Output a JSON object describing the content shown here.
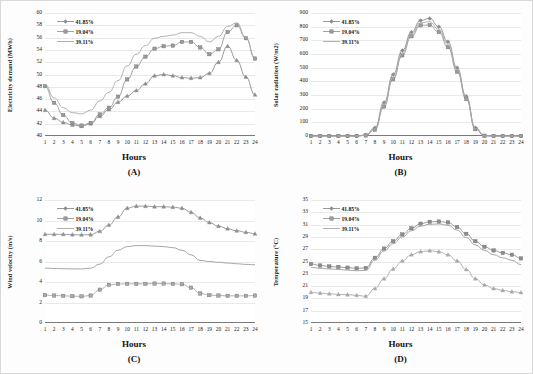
{
  "figure": {
    "background": "#fdfdfd",
    "series_colors": [
      "#8d8d8d",
      "#9a9a9a",
      "#a8a8a8"
    ],
    "panels": [
      "(A)",
      "(B)",
      "(C)",
      "(D)"
    ]
  },
  "legend": {
    "items": [
      {
        "label": "41.85%",
        "marker": "diamond",
        "color": "#8a8a8a"
      },
      {
        "label": "19.04%",
        "marker": "square",
        "color": "#949494"
      },
      {
        "label": "39.11%",
        "marker": "none",
        "color": "#a0a0a0"
      }
    ]
  },
  "chart_data": [
    {
      "type": "line",
      "panel": "(A)",
      "title": "",
      "xlabel": "Hours",
      "ylabel": "Electricity demand (MWh)",
      "ylim": [
        40,
        60
      ],
      "yticks": [
        40,
        42,
        44,
        46,
        48,
        50,
        52,
        54,
        56,
        58,
        60
      ],
      "xlim": [
        1,
        24
      ],
      "x": [
        1,
        2,
        3,
        4,
        5,
        6,
        7,
        8,
        9,
        10,
        11,
        12,
        13,
        14,
        15,
        16,
        17,
        18,
        19,
        20,
        21,
        22,
        23,
        24
      ],
      "xticklabels": [
        "1",
        "2",
        "3",
        "4",
        "5",
        "6",
        "7",
        "8",
        "9",
        "10",
        "11",
        "12",
        "13",
        "14",
        "15",
        "16",
        "17",
        "18",
        "19",
        "20",
        "21",
        "22",
        "23",
        "24"
      ],
      "grid": true,
      "legend_position": "upper-left",
      "series": [
        {
          "name": "41.85%",
          "marker": "triangle",
          "values": [
            44.2,
            42.9,
            42.2,
            41.8,
            41.6,
            42.0,
            43.2,
            44.3,
            45.5,
            46.5,
            47.4,
            48.5,
            49.8,
            50.0,
            49.8,
            49.5,
            49.4,
            49.5,
            50.2,
            52.0,
            54.6,
            52.3,
            49.6,
            46.7
          ]
        },
        {
          "name": "19.04%",
          "marker": "square",
          "values": [
            48.1,
            45.4,
            43.4,
            42.1,
            41.7,
            42.1,
            43.5,
            44.6,
            46.4,
            49.2,
            51.3,
            52.9,
            54.2,
            54.6,
            54.7,
            55.3,
            55.3,
            54.4,
            53.3,
            54.1,
            56.9,
            58.0,
            55.9,
            52.6
          ]
        },
        {
          "name": "39.11%",
          "marker": "none",
          "values": [
            48.4,
            46.2,
            44.6,
            43.8,
            43.6,
            44.2,
            45.7,
            47.1,
            49.0,
            51.4,
            53.3,
            54.7,
            55.9,
            56.2,
            56.4,
            56.8,
            56.8,
            56.2,
            55.3,
            56.2,
            57.8,
            58.4,
            56.0,
            52.7
          ]
        }
      ]
    },
    {
      "type": "line",
      "panel": "(B)",
      "title": "",
      "xlabel": "Hours",
      "ylabel": "Solar radiation (W/m2)",
      "ylim": [
        0,
        900
      ],
      "yticks": [
        0,
        100,
        200,
        300,
        400,
        500,
        600,
        700,
        800,
        900
      ],
      "xlim": [
        1,
        24
      ],
      "x": [
        1,
        2,
        3,
        4,
        5,
        6,
        7,
        8,
        9,
        10,
        11,
        12,
        13,
        14,
        15,
        16,
        17,
        18,
        19,
        20,
        21,
        22,
        23,
        24
      ],
      "xticklabels": [
        "1",
        "2",
        "3",
        "4",
        "5",
        "6",
        "7",
        "8",
        "9",
        "10",
        "11",
        "12",
        "13",
        "14",
        "15",
        "16",
        "17",
        "18",
        "19",
        "20",
        "21",
        "22",
        "23",
        "24"
      ],
      "grid": true,
      "legend_position": "upper-left",
      "series": [
        {
          "name": "41.85%",
          "marker": "diamond",
          "values": [
            0,
            0,
            0,
            0,
            0,
            0,
            8,
            60,
            245,
            450,
            625,
            760,
            845,
            860,
            800,
            690,
            500,
            290,
            60,
            2,
            0,
            0,
            0,
            0
          ]
        },
        {
          "name": "19.04%",
          "marker": "square",
          "values": [
            0,
            0,
            0,
            0,
            0,
            0,
            4,
            45,
            215,
            415,
            590,
            730,
            810,
            812,
            760,
            650,
            470,
            270,
            50,
            2,
            0,
            0,
            0,
            0
          ]
        },
        {
          "name": "39.11%",
          "marker": "none",
          "values": [
            0,
            0,
            0,
            0,
            0,
            0,
            6,
            52,
            230,
            432,
            608,
            745,
            828,
            836,
            780,
            670,
            485,
            280,
            55,
            2,
            0,
            0,
            0,
            0
          ]
        }
      ]
    },
    {
      "type": "line",
      "panel": "(C)",
      "title": "",
      "xlabel": "Hours",
      "ylabel": "Wind velocity (m/s)",
      "ylim": [
        0,
        12
      ],
      "yticks": [
        0,
        2,
        4,
        6,
        8,
        10,
        12
      ],
      "xlim": [
        1,
        24
      ],
      "x": [
        1,
        2,
        3,
        4,
        5,
        6,
        7,
        8,
        9,
        10,
        11,
        12,
        13,
        14,
        15,
        16,
        17,
        18,
        19,
        20,
        21,
        22,
        23,
        24
      ],
      "xticklabels": [
        "1",
        "2",
        "3",
        "4",
        "5",
        "6",
        "7",
        "8",
        "9",
        "10",
        "11",
        "12",
        "13",
        "14",
        "15",
        "16",
        "17",
        "18",
        "19",
        "20",
        "21",
        "22",
        "23",
        "24"
      ],
      "grid": true,
      "legend_position": "upper-left",
      "series": [
        {
          "name": "41.85%",
          "marker": "triangle",
          "values": [
            8.65,
            8.65,
            8.65,
            8.62,
            8.6,
            8.62,
            8.95,
            9.55,
            10.35,
            11.2,
            11.4,
            11.4,
            11.35,
            11.35,
            11.3,
            11.2,
            10.8,
            10.25,
            9.8,
            9.45,
            9.2,
            9.0,
            8.85,
            8.7
          ]
        },
        {
          "name": "19.04%",
          "marker": "none",
          "values": [
            5.35,
            5.32,
            5.3,
            5.28,
            5.28,
            5.35,
            5.75,
            6.45,
            7.1,
            7.45,
            7.55,
            7.55,
            7.5,
            7.45,
            7.35,
            7.1,
            6.65,
            6.1,
            6.0,
            5.92,
            5.85,
            5.78,
            5.72,
            5.68
          ]
        },
        {
          "name": "39.11%",
          "marker": "square",
          "values": [
            2.72,
            2.68,
            2.65,
            2.62,
            2.6,
            2.68,
            3.25,
            3.72,
            3.8,
            3.82,
            3.82,
            3.82,
            3.85,
            3.85,
            3.82,
            3.78,
            3.45,
            2.88,
            2.72,
            2.68,
            2.65,
            2.65,
            2.65,
            2.68
          ]
        }
      ]
    },
    {
      "type": "line",
      "panel": "(D)",
      "title": "",
      "xlabel": "Hours",
      "ylabel": "Temperature (°C)",
      "ylim": [
        15,
        35
      ],
      "yticks": [
        15,
        17,
        19,
        21,
        23,
        25,
        27,
        29,
        31,
        33,
        35
      ],
      "xlim": [
        1,
        24
      ],
      "x": [
        1,
        2,
        3,
        4,
        5,
        6,
        7,
        8,
        9,
        10,
        11,
        12,
        13,
        14,
        15,
        16,
        17,
        18,
        19,
        20,
        21,
        22,
        23,
        24
      ],
      "xticklabels": [
        "1",
        "2",
        "3",
        "4",
        "5",
        "6",
        "7",
        "8",
        "9",
        "10",
        "11",
        "12",
        "13",
        "14",
        "15",
        "16",
        "17",
        "18",
        "19",
        "20",
        "21",
        "22",
        "23",
        "24"
      ],
      "grid": true,
      "legend_position": "upper-left",
      "series": [
        {
          "name": "41.85%",
          "marker": "square",
          "values": [
            24.6,
            24.35,
            24.2,
            24.1,
            24.0,
            23.9,
            23.95,
            25.6,
            27.1,
            28.3,
            29.4,
            30.4,
            31.15,
            31.45,
            31.5,
            31.35,
            30.6,
            29.5,
            28.3,
            27.4,
            26.8,
            26.4,
            26.1,
            25.5
          ]
        },
        {
          "name": "19.04%",
          "marker": "none",
          "values": [
            24.05,
            23.9,
            23.8,
            23.7,
            23.6,
            23.5,
            23.55,
            25.2,
            26.7,
            27.9,
            29.0,
            30.0,
            30.75,
            31.05,
            31.1,
            30.9,
            30.1,
            28.9,
            27.7,
            26.8,
            26.1,
            25.6,
            25.2,
            24.5
          ]
        },
        {
          "name": "39.11%",
          "marker": "triangle",
          "values": [
            20.0,
            19.85,
            19.75,
            19.65,
            19.6,
            19.5,
            19.35,
            20.6,
            22.2,
            23.8,
            25.1,
            26.1,
            26.6,
            26.75,
            26.6,
            26.1,
            25.1,
            23.7,
            22.2,
            21.2,
            20.6,
            20.3,
            20.1,
            19.95
          ]
        }
      ]
    }
  ]
}
